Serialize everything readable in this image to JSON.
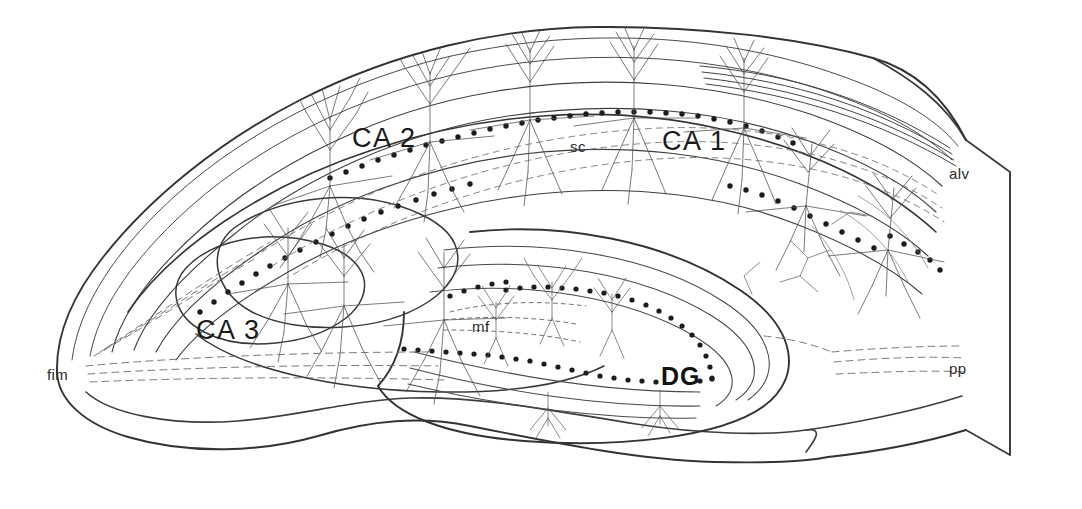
{
  "figure": {
    "kind": "anatomical-line-drawing",
    "background_color": "#ffffff",
    "ink_color": "#333333",
    "cell_ink_color": "#555555",
    "dot_color": "#222222"
  },
  "labels": {
    "ca3": {
      "text": "CA 3",
      "x": 196,
      "y": 317,
      "kind": "major"
    },
    "ca2": {
      "text": "CA 2",
      "x": 352,
      "y": 125,
      "kind": "major"
    },
    "ca1": {
      "text": "CA 1",
      "x": 662,
      "y": 128,
      "kind": "major"
    },
    "dg": {
      "text": "DG",
      "x": 661,
      "y": 364,
      "kind": "dg"
    },
    "fim": {
      "text": "fim",
      "x": 47,
      "y": 367,
      "kind": "minor"
    },
    "mf": {
      "text": "mf",
      "x": 472,
      "y": 319,
      "kind": "minor"
    },
    "sc": {
      "text": "sc",
      "x": 570,
      "y": 139,
      "kind": "minor"
    },
    "alv": {
      "text": "alv",
      "x": 949,
      "y": 166,
      "kind": "minor"
    },
    "pp": {
      "text": "pp",
      "x": 949,
      "y": 361,
      "kind": "minor"
    }
  },
  "regions": [
    {
      "id": "ca1",
      "name": "Cornu Ammonis 1"
    },
    {
      "id": "ca2",
      "name": "Cornu Ammonis 2"
    },
    {
      "id": "ca3",
      "name": "Cornu Ammonis 3"
    },
    {
      "id": "dg",
      "name": "Dentate Gyrus"
    }
  ],
  "pathways": [
    {
      "id": "fim",
      "name": "fimbria"
    },
    {
      "id": "mf",
      "name": "mossy fibers"
    },
    {
      "id": "sc",
      "name": "Schaffer collaterals"
    },
    {
      "id": "alv",
      "name": "alveus"
    },
    {
      "id": "pp",
      "name": "perforant path"
    }
  ]
}
